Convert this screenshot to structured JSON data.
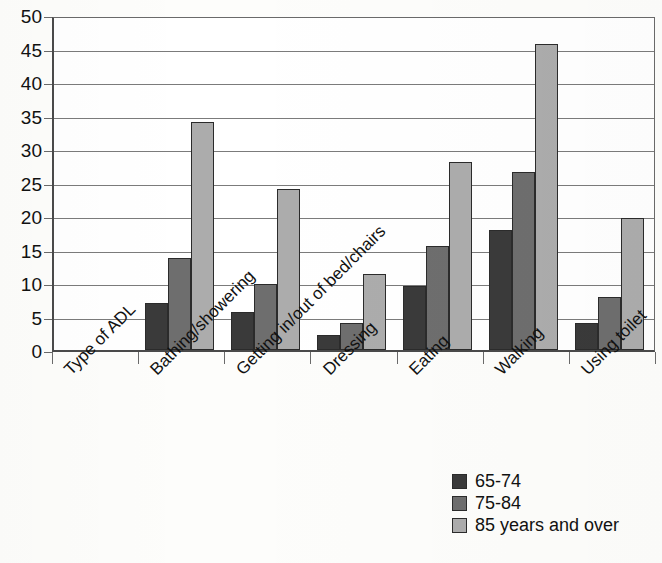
{
  "chart_data": {
    "type": "bar",
    "title": "",
    "xlabel": "Type of ADL",
    "ylabel": "",
    "categories": [
      "Type of ADL",
      "Bathing/showering",
      "Getting in/out of bed/chairs",
      "Dressing",
      "Eating",
      "Walking",
      "Using toilet"
    ],
    "series": [
      {
        "name": "65-74",
        "color": "#3a3a3a",
        "values": [
          null,
          7.0,
          5.6,
          2.2,
          9.5,
          17.9,
          4.0
        ]
      },
      {
        "name": "75-84",
        "color": "#6e6e6e",
        "values": [
          null,
          13.8,
          9.8,
          4.1,
          15.5,
          26.6,
          7.9
        ]
      },
      {
        "name": "85 years and over",
        "color": "#acacac",
        "values": [
          null,
          34.0,
          24.0,
          11.4,
          28.1,
          45.7,
          19.7
        ]
      }
    ],
    "ylim": [
      0,
      50
    ],
    "ytick_values": [
      0,
      5,
      10,
      15,
      20,
      25,
      30,
      35,
      40,
      45,
      50
    ],
    "ytick_labels": [
      "0",
      "5",
      "10",
      "15",
      "20",
      "25",
      "30",
      "35",
      "40",
      "45",
      "50"
    ],
    "grid": true,
    "legend_position": "bottom-right",
    "xtick_rotation": -45
  },
  "legend": {
    "entries": [
      {
        "label": "65-74",
        "color": "#3a3a3a"
      },
      {
        "label": "75-84",
        "color": "#6e6e6e"
      },
      {
        "label": "85 years and over",
        "color": "#acacac"
      }
    ]
  },
  "colors": {
    "background": "#fdfdfb",
    "plot_background": "#ffffff",
    "axis": "#4a4a4a",
    "gridline": "#7b7b7b",
    "series_1": "#3a3a3a",
    "series_2": "#6e6e6e",
    "series_3": "#acacac"
  }
}
